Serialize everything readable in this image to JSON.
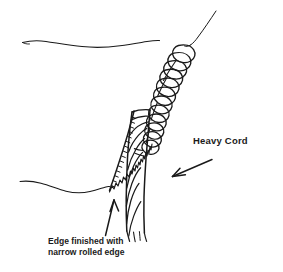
{
  "figure": {
    "type": "line-art-sewing-diagram",
    "background_color": "#ffffff",
    "ink_color": "#1a1a1a",
    "width": 283,
    "height": 272
  },
  "labels": {
    "heavy_cord": "Heavy Cord",
    "caption_line_1": "Edge finished with",
    "caption_line_2": "narrow rolled edge"
  },
  "annotations": {
    "heavy_cord_arrow": "arrow-pointing-down-left",
    "rolled_edge_arrow": "arrow-pointing-up-left"
  },
  "elements": {
    "thread_tail": "thread-tail-upper-right",
    "upper_fabric_edge": "wavy-fabric-edge-upper-left",
    "lower_fabric_edge": "wavy-fabric-edge-lower-left",
    "whipped_loops": "overcast-loop-stitches-wrapping-cord",
    "twisted_cord": "diagonally-twisted-heavy-cord",
    "rolled_edge_line": "serrated-narrow-rolled-edge"
  }
}
